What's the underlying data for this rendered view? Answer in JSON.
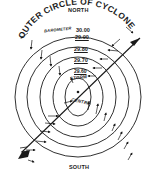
{
  "diagram": {
    "title": "Outer Circle of Cyclone",
    "labels": {
      "north": "NORTH",
      "south": "SOUTH",
      "outer_circle": "OUTER CIRCLE OF CYCLONE",
      "barometer": "BAROMETER",
      "storm": "STORM",
      "centre": "CENTRE"
    },
    "rings": [
      {
        "pressure": "30.00"
      },
      {
        "pressure": "29.90"
      },
      {
        "pressure": "29.80"
      },
      {
        "pressure": "29.70"
      },
      {
        "pressure": "29.60"
      }
    ],
    "path_arrow": "cyclone-track-arrow",
    "wind_arrows": "counterclockwise-circulation",
    "colors": {
      "ink": "#1a1a1a",
      "background": "#ffffff"
    }
  }
}
